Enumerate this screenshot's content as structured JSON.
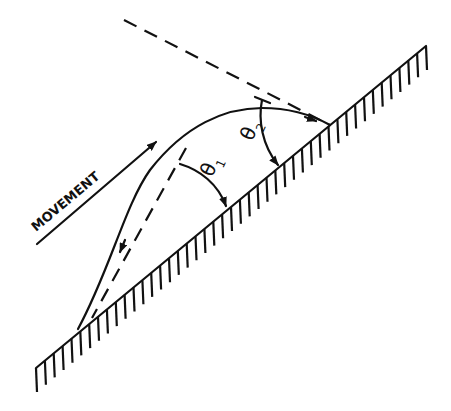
{
  "diagram": {
    "movement_label": "MOVEMENT",
    "angle_1": {
      "symbol": "θ",
      "subscript": "1"
    },
    "angle_2": {
      "symbol": "θ",
      "subscript": "2"
    },
    "colors": {
      "ink": "#111111",
      "background": "#ffffff"
    }
  }
}
